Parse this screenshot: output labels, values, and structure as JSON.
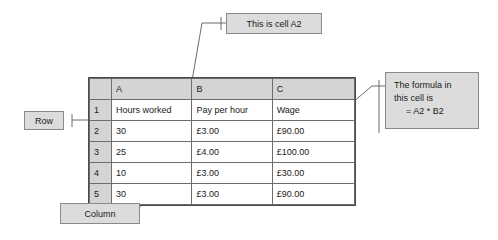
{
  "diagram": {
    "line_color": "#6d6d6d",
    "box_fill": "#dcdcdc",
    "box_border": "#8a8a8a",
    "header_fill": "#d4d4d4"
  },
  "spreadsheet": {
    "corner_label": "",
    "column_headers": [
      "A",
      "B",
      "C"
    ],
    "row_headers": [
      "1",
      "2",
      "3",
      "4",
      "5"
    ],
    "rows": [
      {
        "row_header": "1",
        "cells": [
          "Hours worked",
          "Pay per hour",
          "Wage"
        ]
      },
      {
        "row_header": "2",
        "cells": [
          "30",
          "£3.00",
          "£90.00"
        ]
      },
      {
        "row_header": "3",
        "cells": [
          "25",
          "£4.00",
          "£100.00"
        ]
      },
      {
        "row_header": "4",
        "cells": [
          "10",
          "£3.00",
          "£30.00"
        ]
      },
      {
        "row_header": "5",
        "cells": [
          "30",
          "£3.00",
          "£90.00"
        ]
      }
    ]
  },
  "callouts": {
    "cell_a2": {
      "text": "This is cell A2"
    },
    "formula": {
      "line1": "The formula in",
      "line2": "this cell is",
      "line3": "= A2 * B2"
    },
    "row": {
      "text": "Row"
    },
    "column": {
      "text": "Column"
    }
  }
}
